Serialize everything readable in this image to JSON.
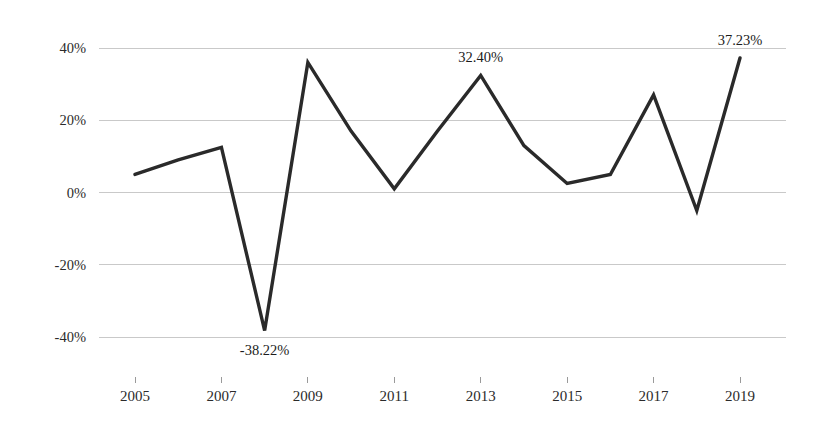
{
  "chart_data": {
    "type": "line",
    "title": "",
    "subtitle": "",
    "xlabel": "",
    "ylabel": "",
    "x": [
      2005,
      2006,
      2007,
      2008,
      2009,
      2010,
      2011,
      2012,
      2013,
      2014,
      2015,
      2016,
      2017,
      2018,
      2019
    ],
    "values": [
      5.0,
      9.0,
      12.5,
      -38.22,
      36.0,
      17.0,
      1.0,
      17.0,
      32.4,
      13.0,
      2.5,
      5.0,
      27.0,
      -5.0,
      37.23
    ],
    "series": [
      {
        "name": "annual return",
        "values": [
          5.0,
          9.0,
          12.5,
          -38.22,
          36.0,
          17.0,
          1.0,
          17.0,
          32.4,
          13.0,
          2.5,
          5.0,
          27.0,
          -5.0,
          37.23
        ]
      }
    ],
    "ylim": [
      -40,
      40
    ],
    "xlim": [
      2005,
      2019
    ],
    "grid": true,
    "legend": false,
    "legend_position": "none",
    "line_color": "#2a2a2a",
    "grid_color": "#c9c9c9",
    "background_color": "#ffffff",
    "y_tick_values": [
      40,
      20,
      0,
      -20,
      -40
    ],
    "y_tick_labels": [
      "40%",
      "20%",
      "0%",
      "-20%",
      "-40%"
    ],
    "x_tick_values": [
      2005,
      2007,
      2009,
      2011,
      2013,
      2015,
      2017,
      2019
    ],
    "x_tick_labels": [
      "2005",
      "2007",
      "2009",
      "2011",
      "2013",
      "2015",
      "2017",
      "2019"
    ],
    "annotations": [
      {
        "x": 2008,
        "y": -38.22,
        "text": "-38.22%",
        "position": "below"
      },
      {
        "x": 2013,
        "y": 32.4,
        "text": "32.40%",
        "position": "above"
      },
      {
        "x": 2019,
        "y": 37.23,
        "text": "37.23%",
        "position": "above"
      }
    ]
  }
}
